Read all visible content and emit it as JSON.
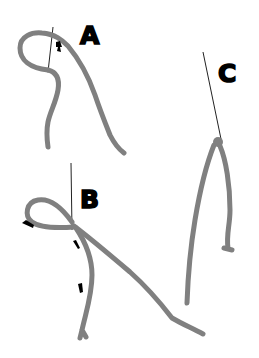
{
  "diagram": {
    "type": "illustration",
    "colors": {
      "yarn": "#808080",
      "needle": "#222222",
      "label": "#000000",
      "background": "#ffffff"
    },
    "panels": [
      {
        "id": "A",
        "label": "A",
        "description": "yarn looped over needle, arrow pointing along loop"
      },
      {
        "id": "B",
        "label": "B",
        "description": "loop pulled tight at needle with three arrows"
      },
      {
        "id": "C",
        "label": "C",
        "description": "knot secured at needle, two tails hanging"
      }
    ]
  }
}
